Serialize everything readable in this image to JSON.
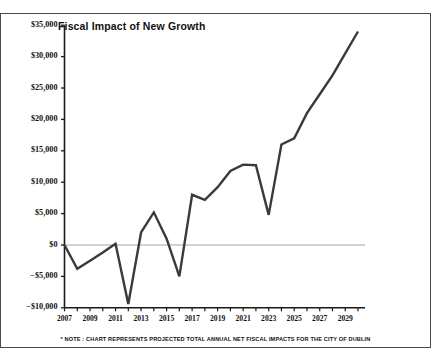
{
  "chart_data": {
    "type": "line",
    "title": "Fiscal Impact of New Growth",
    "xlabel": "",
    "ylabel": "",
    "ylim": [
      -10000,
      35000
    ],
    "xlim": [
      2007,
      2030
    ],
    "grid": false,
    "zero_line": true,
    "legend": "none",
    "y_ticks": [
      -10000,
      -5000,
      0,
      5000,
      10000,
      15000,
      20000,
      25000,
      30000,
      35000
    ],
    "y_tick_labels": [
      "−$10,000",
      "−$5,000",
      "$0",
      "$5,000",
      "$10,000",
      "$15,000",
      "$20,000",
      "$25,000",
      "$30,000",
      "$35,000"
    ],
    "x_ticks": [
      2007,
      2008,
      2009,
      2010,
      2011,
      2012,
      2013,
      2014,
      2015,
      2016,
      2017,
      2018,
      2019,
      2020,
      2021,
      2022,
      2023,
      2024,
      2025,
      2026,
      2027,
      2028,
      2029,
      2030
    ],
    "x_tick_labels_shown": [
      "2007",
      "2009",
      "2011",
      "2013",
      "2015",
      "2017",
      "2019",
      "2021",
      "2023",
      "2025",
      "2027",
      "2029"
    ],
    "categories": [
      2007,
      2008,
      2009,
      2010,
      2011,
      2012,
      2013,
      2014,
      2015,
      2016,
      2017,
      2018,
      2019,
      2020,
      2021,
      2022,
      2023,
      2024,
      2025,
      2026,
      2027,
      2028,
      2029,
      2030
    ],
    "values": [
      0,
      -3800,
      -2500,
      -1200,
      200,
      -9400,
      2000,
      5200,
      1000,
      -5000,
      8000,
      7200,
      9200,
      11800,
      12800,
      12700,
      4800,
      16000,
      17000,
      21000,
      24000,
      27000,
      30500,
      34000
    ],
    "annotations": [
      "* NOTE : CHART REPRESENTS PROJECTED TOTAL ANNUAL NET FISCAL IMPACTS FOR THE CITY OF DUBLIN"
    ],
    "series_color": "#3a3a3a",
    "axis_color": "#1a1a1a",
    "zero_line_color": "#9a9a9a"
  },
  "footnote": "* NOTE : CHART REPRESENTS PROJECTED TOTAL ANNUAL NET FISCAL IMPACTS FOR THE CITY OF DUBLIN"
}
